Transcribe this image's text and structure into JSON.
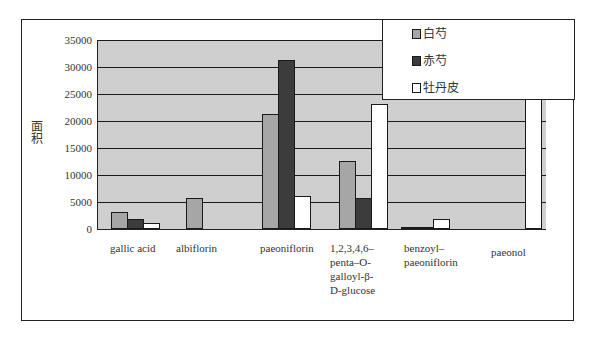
{
  "chart_data": {
    "type": "bar",
    "title": "",
    "xlabel": "",
    "ylabel": "面积",
    "ylim": [
      0,
      35000
    ],
    "yticks": [
      0,
      5000,
      10000,
      15000,
      20000,
      25000,
      30000,
      35000
    ],
    "grid": true,
    "legend_position": "top-right (overlapping plot)",
    "categories": [
      "gallic acid",
      "albiflorin",
      "paeoniflorin",
      "1,2,3,4,6-penta-O-galloyl-β-D-glucose",
      "benzoyl-paeoniflorin",
      "paeonol"
    ],
    "series": [
      {
        "name": "白芍",
        "color": "#a6a6a6",
        "values": [
          3200,
          5700,
          21300,
          12600,
          400,
          0
        ]
      },
      {
        "name": "赤芍",
        "color": "#3c3c3c",
        "values": [
          1900,
          0,
          31300,
          5800,
          300,
          0
        ]
      },
      {
        "name": "牡丹皮",
        "color": "#ffffff",
        "values": [
          1200,
          0,
          6100,
          23200,
          1900,
          36000
        ]
      }
    ],
    "annotations": [
      "paeonol 牡丹皮 bar extends beyond the 35000 axis limit (clipped behind legend)"
    ]
  },
  "axis": {
    "ylabel": "面积",
    "yticks": [
      "35000",
      "30000",
      "25000",
      "20000",
      "15000",
      "10000",
      "5000",
      "0"
    ]
  },
  "xlabels": [
    "gallic acid",
    "albiflorin",
    "paeoniflorin",
    "1,2,3,4,6–\npenta–O-\ngalloyl-β-\nD-glucose",
    "benzoyl–\npaeoniflorin",
    "paeonol"
  ],
  "legend": [
    {
      "label": "白芍",
      "color": "#a6a6a6"
    },
    {
      "label": "赤芍",
      "color": "#3c3c3c"
    },
    {
      "label": "牡丹皮",
      "color": "#ffffff"
    }
  ]
}
